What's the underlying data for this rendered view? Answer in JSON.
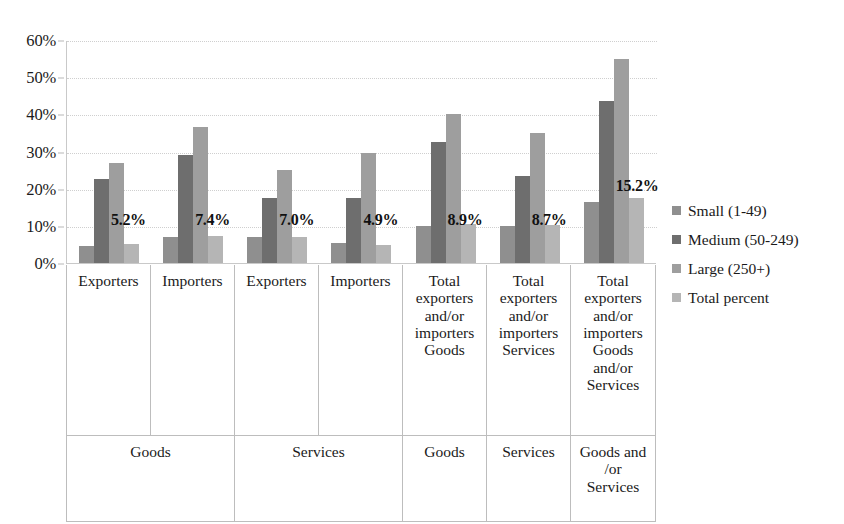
{
  "chart_data": {
    "type": "bar",
    "title": "",
    "subtitle": "",
    "xlabel": "",
    "ylabel": "",
    "ylim": [
      0,
      60
    ],
    "ytick_values": [
      0,
      10,
      20,
      30,
      40,
      50,
      60
    ],
    "ytick_labels": [
      "0%",
      "10%",
      "20%",
      "30%",
      "40%",
      "50%",
      "60%"
    ],
    "grid": true,
    "legend_position": "right",
    "categories": [
      "Exporters",
      "Importers",
      "Exporters",
      "Importers",
      "Total exporters and/or importers Goods",
      "Total exporters and/or importers Services",
      "Total exporters and/or importers Goods and/or Services"
    ],
    "series": [
      {
        "name": "Small (1-49)",
        "color": "#8f8f8f",
        "values": [
          4.5,
          7.0,
          7.0,
          5.5,
          10.0,
          10.0,
          16.5
        ]
      },
      {
        "name": "Medium (50-249)",
        "color": "#6e6e6e",
        "values": [
          22.5,
          29.0,
          17.5,
          17.5,
          32.5,
          23.5,
          43.5
        ]
      },
      {
        "name": "Large (250+)",
        "color": "#9e9e9e",
        "values": [
          27.0,
          36.5,
          25.0,
          29.5,
          40.0,
          35.0,
          55.0
        ]
      },
      {
        "name": "Total percent",
        "color": "#b5b5b5",
        "values": [
          5.2,
          7.4,
          7.0,
          4.9,
          10.5,
          10.3,
          17.5
        ]
      }
    ],
    "data_labels": [
      "5.2%",
      "7.4%",
      "7.0%",
      "4.9%",
      "8.9%",
      "8.7%",
      "15.2%"
    ],
    "annotations": [
      {
        "text": "5.2%",
        "group": 0
      },
      {
        "text": "7.4%",
        "group": 1
      },
      {
        "text": "7.0%",
        "group": 2
      },
      {
        "text": "4.9%",
        "group": 3
      },
      {
        "text": "8.9%",
        "group": 4
      },
      {
        "text": "8.7%",
        "group": 5
      },
      {
        "text": "15.2%",
        "group": 6
      }
    ]
  },
  "y_axis": {
    "ticks": [
      {
        "label": "60%",
        "value": 60
      },
      {
        "label": "50%",
        "value": 50
      },
      {
        "label": "40%",
        "value": 40
      },
      {
        "label": "30%",
        "value": 30
      },
      {
        "label": "20%",
        "value": 20
      },
      {
        "label": "10%",
        "value": 10
      },
      {
        "label": "0%",
        "value": 0
      }
    ]
  },
  "category_table": {
    "row1": [
      {
        "lines": [
          "Exporters"
        ]
      },
      {
        "lines": [
          "Importers"
        ]
      },
      {
        "lines": [
          "Exporters"
        ]
      },
      {
        "lines": [
          "Importers"
        ]
      },
      {
        "lines": [
          "Total",
          "exporters",
          "and/or",
          "importers",
          "Goods"
        ]
      },
      {
        "lines": [
          "Total",
          "exporters",
          "and/or",
          "importers",
          "Services"
        ]
      },
      {
        "lines": [
          "Total",
          "exporters",
          "and/or",
          "importers",
          "Goods",
          "and/or",
          "Services"
        ]
      }
    ],
    "row2": [
      {
        "lines": [
          "Goods"
        ],
        "span": 2
      },
      {
        "lines": [
          "Services"
        ],
        "span": 2
      },
      {
        "lines": [
          "Goods"
        ],
        "span": 1
      },
      {
        "lines": [
          "Services"
        ],
        "span": 1
      },
      {
        "lines": [
          "Goods and",
          "/or",
          "Services"
        ],
        "span": 1
      }
    ]
  },
  "legend": {
    "items": [
      {
        "label": "Small (1-49)",
        "color": "#8f8f8f"
      },
      {
        "label": "Medium (50-249)",
        "color": "#6e6e6e"
      },
      {
        "label": "Large (250+)",
        "color": "#9e9e9e"
      },
      {
        "label": "Total percent",
        "color": "#b5b5b5"
      }
    ]
  }
}
